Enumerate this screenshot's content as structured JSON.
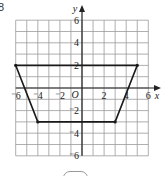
{
  "question_number": "8",
  "axes": {
    "x_label": "x",
    "y_label": "y",
    "origin_label": "O",
    "x_ticks": [
      "-6",
      "-4",
      "-2",
      "2",
      "4",
      "6"
    ],
    "y_ticks": [
      "6",
      "4",
      "2",
      "-2",
      "-4",
      "-6"
    ],
    "x_range": [
      -6,
      6
    ],
    "y_range": [
      -6,
      6
    ]
  },
  "shape": {
    "type": "trapezium",
    "vertices": [
      [
        -6,
        2
      ],
      [
        5,
        2
      ],
      [
        3,
        -3
      ],
      [
        -4,
        -3
      ]
    ]
  },
  "colors": {
    "grid": "#9a9a9a",
    "axis": "#222222",
    "shape": "#1a1a1a"
  }
}
